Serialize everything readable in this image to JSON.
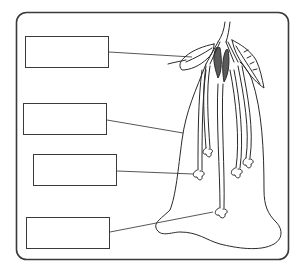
{
  "diagram": {
    "colors": {
      "stroke": "#2a2a2a",
      "frame": "#3a3a3a",
      "background": "#ffffff"
    },
    "labels": [
      {
        "id": "label-1",
        "text": "",
        "points_to": "anther-pollen-region"
      },
      {
        "id": "label-2",
        "text": "",
        "points_to": "style-ovary-wall"
      },
      {
        "id": "label-3",
        "text": "",
        "points_to": "ovule-at-pollen-tube-tip"
      },
      {
        "id": "label-4",
        "text": "",
        "points_to": "lower-ovule-at-base"
      }
    ]
  }
}
